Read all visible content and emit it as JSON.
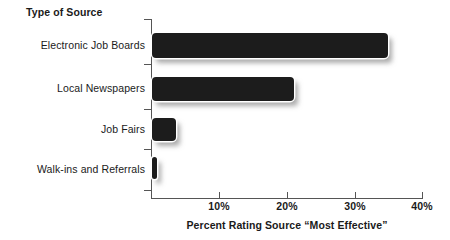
{
  "chart_data": {
    "type": "bar",
    "orientation": "horizontal",
    "title": "",
    "categories": [
      "Electronic Job Boards",
      "Local Newspapers",
      "Job Fairs",
      "Walk-ins and Referrals"
    ],
    "values": [
      35,
      21,
      3.5,
      0.8
    ],
    "xlabel": "Percent Rating Source \"Most Effective\"",
    "ylabel": "Type of Source",
    "xlim": [
      0,
      40
    ],
    "xticks": [
      0,
      10,
      20,
      30,
      40
    ],
    "xtick_labels": [
      "",
      "10%",
      "20%",
      "30%",
      "40%"
    ],
    "grid": false,
    "legend": null,
    "bar_color": "#1c1c1c",
    "axis_color": "#555555",
    "background": "#ffffff"
  },
  "axes": {
    "y_title": "Type of Source",
    "x_title": "Percent Rating Source “Most Effective”",
    "x_labels": [
      {
        "text": "10%",
        "value": 10
      },
      {
        "text": "20%",
        "value": 20
      },
      {
        "text": "30%",
        "value": 30
      },
      {
        "text": "40%",
        "value": 40
      }
    ]
  },
  "bars": [
    {
      "label": "Electronic Job Boards",
      "value": 35
    },
    {
      "label": "Local Newspapers",
      "value": 21
    },
    {
      "label": "Job Fairs",
      "value": 3.5
    },
    {
      "label": "Walk-ins and Referrals",
      "value": 0.8
    }
  ]
}
